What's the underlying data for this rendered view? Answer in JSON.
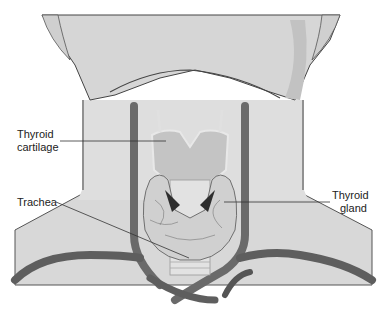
{
  "figure": {
    "labels": {
      "thyroid_cartilage": [
        "Thyroid",
        "cartilage"
      ],
      "trachea": "Trachea",
      "thyroid_gland": [
        "Thyroid",
        "gland"
      ]
    },
    "colors": {
      "background": "#ffffff",
      "skin": "#dcdcdc",
      "skin_shadow": "#c4c4c4",
      "vessel": "#6e6e6e",
      "vessel_dark": "#4a4a4a",
      "cartilage": "#bdbdbd",
      "gland": "#cfcfcf",
      "leader_line": "#333333"
    }
  }
}
